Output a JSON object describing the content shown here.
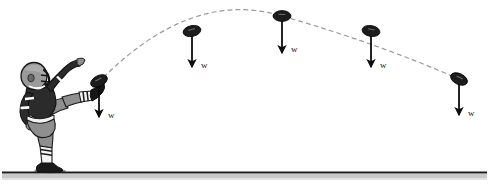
{
  "figure": {
    "background_color": "#ffffff",
    "width": 489,
    "height": 190
  },
  "colors": {
    "ball": "#1c1c1c",
    "arrow": "#0d0d0d",
    "trajectory": "#9a9a9a",
    "ground_line": "#1a1a1a",
    "ground_shadow": "#bdbdbd",
    "jersey": "#2b2b2b",
    "pants": "#8f8f8f",
    "helmet": "#9a9a9a",
    "stripe": "#ffffff",
    "outline": "#111111",
    "label_text": "#1a1a1a"
  },
  "ground": {
    "name": "ground-line",
    "y": 172,
    "x_start": 2,
    "x_end": 487
  },
  "trajectory": {
    "name": "trajectory-path",
    "style": "dashed",
    "dash_pattern": "4 4",
    "start": {
      "x": 98,
      "y": 82
    },
    "apex": {
      "x": 282,
      "y": 16
    },
    "end": {
      "x": 460,
      "y": 80
    }
  },
  "player": {
    "name": "football-punter",
    "description": "Football punter in kicking follow-through",
    "helmet_color": "#9a9a9a",
    "jersey_color": "#2b2b2b",
    "pants_color": "#8f8f8f"
  },
  "balls": [
    {
      "id": "ball-1",
      "label": "w",
      "x": 99,
      "y": 81,
      "rotation": -28,
      "arrow_length": 36,
      "label_dx": 9,
      "label_dy": 30
    },
    {
      "id": "ball-2",
      "label": "w",
      "x": 192,
      "y": 31,
      "rotation": -12,
      "arrow_length": 36,
      "label_dx": 9,
      "label_dy": 30
    },
    {
      "id": "ball-3",
      "label": "w",
      "x": 282,
      "y": 16,
      "rotation": 0,
      "arrow_length": 37,
      "label_dx": 9,
      "label_dy": 29
    },
    {
      "id": "ball-4",
      "label": "w",
      "x": 371,
      "y": 31,
      "rotation": 10,
      "arrow_length": 36,
      "label_dx": 9,
      "label_dy": 30
    },
    {
      "id": "ball-5",
      "label": "w",
      "x": 459,
      "y": 79,
      "rotation": 26,
      "arrow_length": 36,
      "label_dx": 9,
      "label_dy": 30
    }
  ]
}
